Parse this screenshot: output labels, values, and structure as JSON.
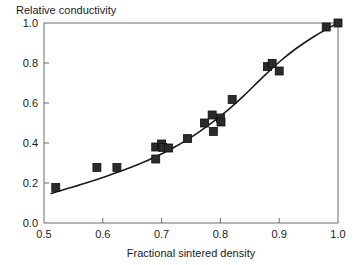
{
  "chart_data": {
    "type": "scatter",
    "title": "",
    "xlabel": "Fractional sintered density",
    "ylabel": "Relative conductivity",
    "xlim": [
      0.5,
      1.0
    ],
    "ylim": [
      0.0,
      1.0
    ],
    "xticks": [
      "0.5",
      "0.6",
      "0.7",
      "0.8",
      "0.9",
      "1.0"
    ],
    "xtick_values": [
      0.5,
      0.6,
      0.7,
      0.8,
      0.9,
      1.0
    ],
    "yticks": [
      "0.0",
      "0.2",
      "0.4",
      "0.6",
      "0.8",
      "1.0"
    ],
    "ytick_values": [
      0.0,
      0.2,
      0.4,
      0.6,
      0.8,
      1.0
    ],
    "grid": false,
    "legend": null,
    "marker": "filled-square",
    "marker_color": "#2b2b2b",
    "line_color": "#1a1a1a",
    "series": [
      {
        "name": "measured",
        "type": "scatter",
        "points": [
          {
            "x": 0.52,
            "y": 0.178
          },
          {
            "x": 0.59,
            "y": 0.278
          },
          {
            "x": 0.624,
            "y": 0.278
          },
          {
            "x": 0.69,
            "y": 0.38
          },
          {
            "x": 0.69,
            "y": 0.32
          },
          {
            "x": 0.7,
            "y": 0.395
          },
          {
            "x": 0.702,
            "y": 0.378
          },
          {
            "x": 0.712,
            "y": 0.375
          },
          {
            "x": 0.744,
            "y": 0.422
          },
          {
            "x": 0.773,
            "y": 0.5
          },
          {
            "x": 0.786,
            "y": 0.54
          },
          {
            "x": 0.788,
            "y": 0.458
          },
          {
            "x": 0.8,
            "y": 0.525
          },
          {
            "x": 0.801,
            "y": 0.505
          },
          {
            "x": 0.82,
            "y": 0.618
          },
          {
            "x": 0.88,
            "y": 0.782
          },
          {
            "x": 0.888,
            "y": 0.798
          },
          {
            "x": 0.9,
            "y": 0.76
          },
          {
            "x": 0.98,
            "y": 0.98
          },
          {
            "x": 1.0,
            "y": 1.0
          }
        ]
      },
      {
        "name": "fit-curve",
        "type": "line",
        "points": [
          {
            "x": 0.512,
            "y": 0.148
          },
          {
            "x": 0.54,
            "y": 0.172
          },
          {
            "x": 0.57,
            "y": 0.199
          },
          {
            "x": 0.6,
            "y": 0.228
          },
          {
            "x": 0.63,
            "y": 0.259
          },
          {
            "x": 0.66,
            "y": 0.293
          },
          {
            "x": 0.69,
            "y": 0.331
          },
          {
            "x": 0.72,
            "y": 0.376
          },
          {
            "x": 0.75,
            "y": 0.428
          },
          {
            "x": 0.78,
            "y": 0.489
          },
          {
            "x": 0.81,
            "y": 0.558
          },
          {
            "x": 0.84,
            "y": 0.637
          },
          {
            "x": 0.87,
            "y": 0.723
          },
          {
            "x": 0.9,
            "y": 0.805
          },
          {
            "x": 0.93,
            "y": 0.875
          },
          {
            "x": 0.96,
            "y": 0.934
          },
          {
            "x": 0.98,
            "y": 0.968
          },
          {
            "x": 1.0,
            "y": 1.0
          }
        ]
      }
    ]
  }
}
